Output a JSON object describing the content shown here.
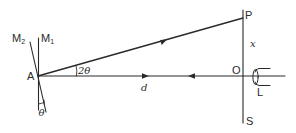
{
  "figure": {
    "type": "optical-lever-diagram",
    "colors": {
      "line": "#2a2a2a",
      "background": "#ffffff"
    },
    "labels": {
      "mirror2": "M",
      "mirror2_sub": "2",
      "mirror1": "M",
      "mirror1_sub": "1",
      "point_a": "A",
      "angle_2theta": "2θ",
      "angle_theta": "θ",
      "distance": "d",
      "point_p": "P",
      "displacement": "x",
      "point_o": "O",
      "lens": "L",
      "scale": "S"
    },
    "elements": {
      "mirror_m1": "vertical line through A",
      "mirror_m2": "line through A tilted by angle θ from M1",
      "incident_ray": "horizontal ray from O toward A (arrow pointing left)",
      "reflected_ray_back": "arrow pointing right along AO",
      "reflected_ray": "ray from A to P at angle 2θ (arrow pointing toward P)",
      "scale": "vertical scale PS through O",
      "telescope": "lens L at O looking along OA"
    }
  }
}
